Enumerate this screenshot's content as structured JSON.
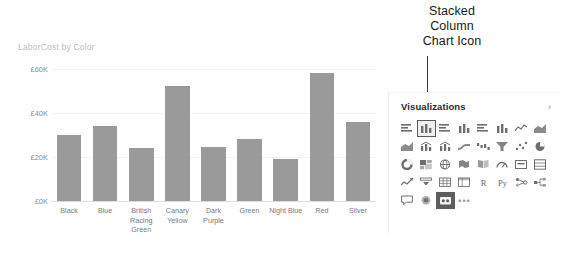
{
  "annotation": {
    "lines": [
      "Stacked",
      "Column",
      "Chart Icon"
    ],
    "callout": "callout-line"
  },
  "chart_data": {
    "type": "bar",
    "title": "LaborCost by Color",
    "xlabel": "",
    "ylabel": "",
    "categories": [
      "Black",
      "Blue",
      "British Racing Green",
      "Canary Yellow",
      "Dark Purple",
      "Green",
      "Night Blue",
      "Red",
      "Silver"
    ],
    "values": [
      30000,
      34000,
      24000,
      52000,
      24500,
      28000,
      19000,
      58000,
      36000
    ],
    "ytick_labels": [
      "£60K",
      "£40K",
      "£20K",
      "£0K"
    ],
    "ytick_values": [
      60000,
      40000,
      20000,
      0
    ],
    "ylim": [
      0,
      64000
    ],
    "grid": true,
    "legend": false,
    "bar_color": "#9a9a9a",
    "title_color": "#bdbdbd",
    "axis_text_color": "#8d8d8d"
  },
  "viz_pane": {
    "title": "Visualizations",
    "chevron_icon": "chevron-right-icon",
    "selected_icon": "stacked-column-chart-icon",
    "icons": [
      {
        "name": "stacked-bar-chart-icon",
        "glyph": "hbar"
      },
      {
        "name": "stacked-column-chart-icon",
        "glyph": "vbar",
        "selected": true
      },
      {
        "name": "clustered-bar-chart-icon",
        "glyph": "hbar"
      },
      {
        "name": "clustered-column-chart-icon",
        "glyph": "vbar"
      },
      {
        "name": "100-stacked-bar-chart-icon",
        "glyph": "hbar"
      },
      {
        "name": "100-stacked-column-chart-icon",
        "glyph": "vbar"
      },
      {
        "name": "line-chart-icon",
        "glyph": "line"
      },
      {
        "name": "area-chart-icon",
        "glyph": "area"
      },
      {
        "name": "stacked-area-chart-icon",
        "glyph": "area"
      },
      {
        "name": "line-stacked-column-chart-icon",
        "glyph": "combo"
      },
      {
        "name": "line-clustered-column-chart-icon",
        "glyph": "combo"
      },
      {
        "name": "ribbon-chart-icon",
        "glyph": "ribbon"
      },
      {
        "name": "waterfall-chart-icon",
        "glyph": "waterfall"
      },
      {
        "name": "funnel-chart-icon",
        "glyph": "funnel"
      },
      {
        "name": "scatter-chart-icon",
        "glyph": "scatter"
      },
      {
        "name": "pie-chart-icon",
        "glyph": "pie"
      },
      {
        "name": "donut-chart-icon",
        "glyph": "donut"
      },
      {
        "name": "treemap-icon",
        "glyph": "treemap"
      },
      {
        "name": "map-icon",
        "glyph": "globe"
      },
      {
        "name": "filled-map-icon",
        "glyph": "filledmap"
      },
      {
        "name": "shape-map-icon",
        "glyph": "shapemap"
      },
      {
        "name": "gauge-icon",
        "glyph": "gauge"
      },
      {
        "name": "card-icon",
        "glyph": "card"
      },
      {
        "name": "multi-row-card-icon",
        "glyph": "multicard"
      },
      {
        "name": "kpi-icon",
        "glyph": "kpi"
      },
      {
        "name": "slicer-icon",
        "glyph": "slicer"
      },
      {
        "name": "table-icon",
        "glyph": "table"
      },
      {
        "name": "matrix-icon",
        "glyph": "matrix"
      },
      {
        "name": "r-script-visual-icon",
        "glyph": "text",
        "label": "R"
      },
      {
        "name": "python-visual-icon",
        "glyph": "text",
        "label": "Py"
      },
      {
        "name": "key-influencers-icon",
        "glyph": "influencers"
      },
      {
        "name": "decomposition-tree-icon",
        "glyph": "decomptree"
      },
      {
        "name": "q-and-a-icon",
        "glyph": "qna"
      },
      {
        "name": "smart-narrative-icon",
        "glyph": "narrative"
      },
      {
        "name": "paginated-report-icon",
        "glyph": "paginated",
        "dark": true
      },
      {
        "name": "more-visuals-icon",
        "glyph": "ellipsis",
        "label": "•••"
      }
    ]
  }
}
